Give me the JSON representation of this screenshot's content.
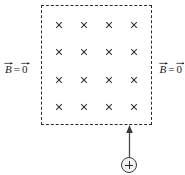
{
  "figure": {
    "type": "physics-diagram",
    "background_color": "#ffffff",
    "ink_color": "#2b2b2b"
  },
  "field_region": {
    "name": "magnetic-field-region",
    "border_style": "dashed",
    "border_color": "#2b2b2b",
    "field_direction": "into-the-page",
    "field_symbol": "×",
    "grid_rows": 4,
    "grid_cols": 4,
    "marks": [
      [
        "×",
        "×",
        "×",
        "×"
      ],
      [
        "×",
        "×",
        "×",
        "×"
      ],
      [
        "×",
        "×",
        "×",
        "×"
      ],
      [
        "×",
        "×",
        "×",
        "×"
      ]
    ]
  },
  "labels": {
    "left": {
      "name": "b-field-zero-left",
      "symbol": "B",
      "equals": "=",
      "value": "0",
      "full_text": "B⃗ = 0⃗",
      "meaning": "magnetic field is zero outside region"
    },
    "right": {
      "name": "b-field-zero-right",
      "symbol": "B",
      "equals": "=",
      "value": "0",
      "full_text": "B⃗ = 0⃗",
      "meaning": "magnetic field is zero outside region"
    }
  },
  "charge": {
    "name": "positive-point-charge",
    "sign": "+",
    "polarity": "positive",
    "fill_color": "#f2f2f2",
    "outline_color": "#3a3a3a"
  },
  "velocity_arrow": {
    "name": "velocity-arrow",
    "direction": "up",
    "color": "#3a3a3a",
    "label": ""
  }
}
